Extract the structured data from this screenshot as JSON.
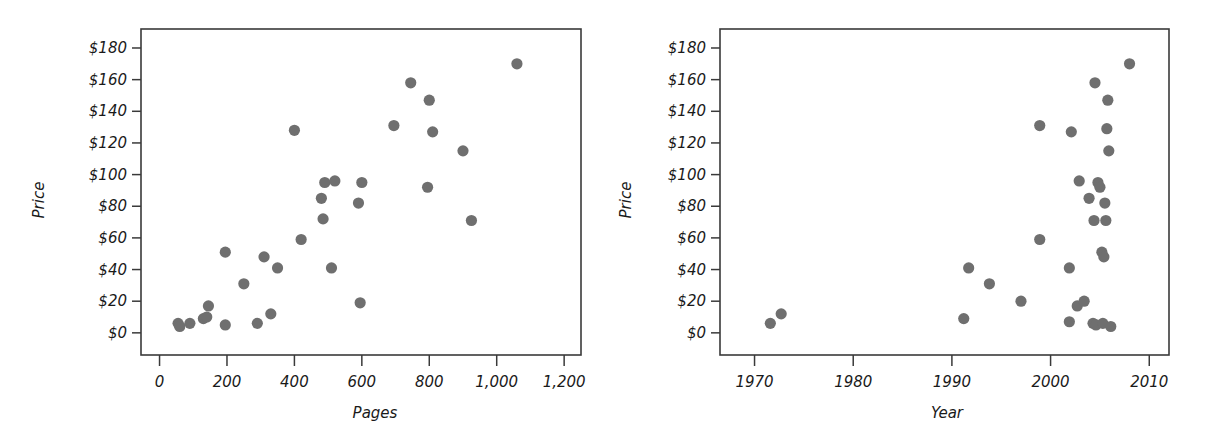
{
  "figure": {
    "background": "#ffffff",
    "point_color": "#6f6f6f",
    "axis_color": "#3a3a3a",
    "panel_count": 2
  },
  "chart_data": [
    {
      "type": "scatter",
      "title": "",
      "xlabel": "Pages",
      "ylabel": "Price",
      "xlim": [
        -55,
        1250
      ],
      "ylim": [
        -14,
        192
      ],
      "grid": false,
      "legend": "none",
      "xticks": [
        0,
        200,
        400,
        600,
        800,
        1000,
        1200
      ],
      "xticklabels": [
        "0",
        "200",
        "400",
        "600",
        "800",
        "1,000",
        "1,200"
      ],
      "yticks": [
        0,
        20,
        40,
        60,
        80,
        100,
        120,
        140,
        160,
        180
      ],
      "yticklabels": [
        "$0",
        "$20",
        "$40",
        "$60",
        "$80",
        "$100",
        "$120",
        "$140",
        "$160",
        "$180"
      ],
      "x": [
        55,
        60,
        90,
        130,
        140,
        145,
        195,
        195,
        250,
        290,
        310,
        330,
        350,
        400,
        420,
        480,
        485,
        490,
        510,
        520,
        590,
        595,
        600,
        695,
        745,
        795,
        800,
        810,
        900,
        925,
        1060
      ],
      "y": [
        6,
        4,
        6,
        9,
        10,
        17,
        5,
        51,
        31,
        6,
        48,
        12,
        41,
        128,
        59,
        85,
        72,
        95,
        41,
        96,
        82,
        19,
        95,
        131,
        158,
        92,
        147,
        127,
        115,
        71,
        170
      ]
    },
    {
      "type": "scatter",
      "title": "",
      "xlabel": "Year",
      "ylabel": "Price",
      "xlim": [
        1966.5,
        2012
      ],
      "ylim": [
        -14,
        192
      ],
      "grid": false,
      "legend": "none",
      "xticks": [
        1970,
        1980,
        1990,
        2000,
        2010
      ],
      "xticklabels": [
        "1970",
        "1980",
        "1990",
        "2000",
        "2010"
      ],
      "yticks": [
        0,
        20,
        40,
        60,
        80,
        100,
        120,
        140,
        160,
        180
      ],
      "yticklabels": [
        "$0",
        "$20",
        "$40",
        "$60",
        "$80",
        "$100",
        "$120",
        "$140",
        "$160",
        "$180"
      ],
      "x": [
        1971.6,
        1972.7,
        1991.2,
        1991.7,
        1993.8,
        1997.0,
        1998.9,
        1998.9,
        2001.9,
        2001.9,
        2002.1,
        2002.7,
        2002.9,
        2003.4,
        2003.9,
        2004.3,
        2004.4,
        2004.5,
        2004.6,
        2004.8,
        2005.0,
        2005.2,
        2005.3,
        2005.4,
        2005.5,
        2005.6,
        2005.7,
        2005.8,
        2005.9,
        2006.1,
        2008.0
      ],
      "y": [
        6,
        12,
        9,
        41,
        31,
        20,
        59,
        131,
        7,
        41,
        127,
        17,
        96,
        20,
        85,
        6,
        71,
        158,
        5,
        95,
        92,
        51,
        6,
        48,
        82,
        71,
        129,
        147,
        115,
        4,
        170
      ]
    }
  ]
}
